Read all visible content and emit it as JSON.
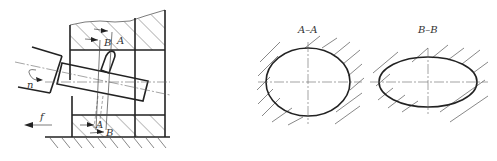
{
  "figure": {
    "left_view": {
      "labels": {
        "rotation": "n",
        "feed": "f",
        "section_a_top": "A",
        "section_b_top": "B",
        "section_a_bottom": "A",
        "section_b_bottom": "B"
      }
    },
    "sections": [
      {
        "title": "A–A",
        "shape": "ellipse-near-circular"
      },
      {
        "title": "B–B",
        "shape": "ellipse-elongated"
      }
    ]
  }
}
